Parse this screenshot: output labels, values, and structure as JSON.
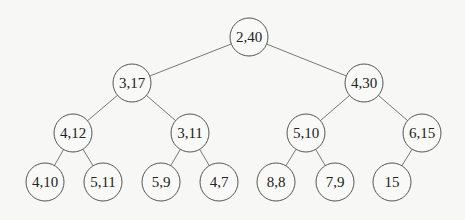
{
  "diagram": {
    "type": "binary-tree",
    "node_radius": 19,
    "colors": {
      "background": "#f7f7f5",
      "node_fill": "#f9f9f7",
      "node_stroke": "#555555",
      "edge": "#777777",
      "text": "#222222"
    },
    "nodes": [
      {
        "id": "n0",
        "label": "2,40",
        "x": 249,
        "y": 37
      },
      {
        "id": "n1",
        "label": "3,17",
        "x": 132,
        "y": 83
      },
      {
        "id": "n2",
        "label": "4,30",
        "x": 364,
        "y": 83
      },
      {
        "id": "n3",
        "label": "4,12",
        "x": 73,
        "y": 133
      },
      {
        "id": "n4",
        "label": "3,11",
        "x": 190,
        "y": 133
      },
      {
        "id": "n5",
        "label": "5,10",
        "x": 306,
        "y": 133
      },
      {
        "id": "n6",
        "label": "6,15",
        "x": 422,
        "y": 133
      },
      {
        "id": "n7",
        "label": "4,10",
        "x": 45,
        "y": 182
      },
      {
        "id": "n8",
        "label": "5,11",
        "x": 103,
        "y": 182
      },
      {
        "id": "n9",
        "label": "5,9",
        "x": 161,
        "y": 182
      },
      {
        "id": "n10",
        "label": "4,7",
        "x": 219,
        "y": 182
      },
      {
        "id": "n11",
        "label": "8,8",
        "x": 276,
        "y": 182
      },
      {
        "id": "n12",
        "label": "7,9",
        "x": 335,
        "y": 182
      },
      {
        "id": "n13",
        "label": "15",
        "x": 392,
        "y": 182
      }
    ],
    "edges": [
      [
        "n0",
        "n1"
      ],
      [
        "n0",
        "n2"
      ],
      [
        "n1",
        "n3"
      ],
      [
        "n1",
        "n4"
      ],
      [
        "n2",
        "n5"
      ],
      [
        "n2",
        "n6"
      ],
      [
        "n3",
        "n7"
      ],
      [
        "n3",
        "n8"
      ],
      [
        "n4",
        "n9"
      ],
      [
        "n4",
        "n10"
      ],
      [
        "n5",
        "n11"
      ],
      [
        "n5",
        "n12"
      ],
      [
        "n6",
        "n13"
      ]
    ]
  }
}
